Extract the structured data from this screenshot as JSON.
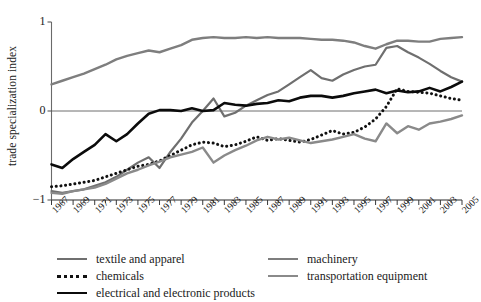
{
  "chart_data": {
    "type": "line",
    "title": "",
    "xlabel": "",
    "ylabel": "trade specialization index",
    "xlim": [
      1967,
      2005
    ],
    "ylim": [
      -1,
      1
    ],
    "yticks": [
      1,
      0,
      -1
    ],
    "ytick_labels": [
      "1",
      "0",
      "−1"
    ],
    "grid": false,
    "zero_line": true,
    "legend_position": "bottom",
    "x": [
      1967,
      1968,
      1969,
      1970,
      1971,
      1972,
      1973,
      1974,
      1975,
      1976,
      1977,
      1978,
      1979,
      1980,
      1981,
      1982,
      1983,
      1984,
      1985,
      1986,
      1987,
      1988,
      1989,
      1990,
      1991,
      1992,
      1993,
      1994,
      1995,
      1996,
      1997,
      1998,
      1999,
      2000,
      2001,
      2002,
      2003,
      2004,
      2005
    ],
    "xtick_labels": [
      "1967",
      "1969",
      "1971",
      "1973",
      "1975",
      "1977",
      "1979",
      "1981",
      "1983",
      "1985",
      "1987",
      "1989",
      "1991",
      "1993",
      "1995",
      "1997",
      "1999",
      "2001",
      "2003",
      "2005"
    ],
    "series": [
      {
        "name": "textile and apparel",
        "color": "#6f6f6f",
        "style": "solid",
        "width": 2.2,
        "values": [
          -0.9,
          -0.92,
          -0.9,
          -0.88,
          -0.84,
          -0.8,
          -0.74,
          -0.66,
          -0.58,
          -0.52,
          -0.64,
          -0.46,
          -0.31,
          -0.13,
          0.0,
          0.14,
          -0.06,
          -0.02,
          0.06,
          0.12,
          0.18,
          0.22,
          0.3,
          0.38,
          0.46,
          0.37,
          0.34,
          0.41,
          0.46,
          0.5,
          0.52,
          0.71,
          0.73,
          0.66,
          0.6,
          0.53,
          0.45,
          0.38,
          0.33
        ]
      },
      {
        "name": "chemicals",
        "color": "#111111",
        "style": "dotted",
        "width": 3.0,
        "values": [
          -0.85,
          -0.84,
          -0.82,
          -0.8,
          -0.78,
          -0.74,
          -0.7,
          -0.66,
          -0.62,
          -0.6,
          -0.56,
          -0.5,
          -0.44,
          -0.38,
          -0.35,
          -0.36,
          -0.4,
          -0.38,
          -0.34,
          -0.29,
          -0.33,
          -0.31,
          -0.33,
          -0.35,
          -0.32,
          -0.27,
          -0.22,
          -0.26,
          -0.24,
          -0.18,
          -0.09,
          0.05,
          0.25,
          0.22,
          0.21,
          0.2,
          0.17,
          0.14,
          0.12
        ]
      },
      {
        "name": "electrical and electronic products",
        "color": "#0b0b0b",
        "style": "solid",
        "width": 2.6,
        "values": [
          -0.6,
          -0.64,
          -0.54,
          -0.46,
          -0.38,
          -0.26,
          -0.34,
          -0.26,
          -0.14,
          -0.03,
          0.01,
          0.01,
          0.0,
          0.03,
          0.0,
          0.01,
          0.09,
          0.07,
          0.06,
          0.08,
          0.09,
          0.12,
          0.11,
          0.15,
          0.17,
          0.17,
          0.15,
          0.17,
          0.2,
          0.22,
          0.24,
          0.2,
          0.23,
          0.21,
          0.22,
          0.26,
          0.22,
          0.27,
          0.33
        ]
      },
      {
        "name": "machinery",
        "color": "#7e7e7e",
        "style": "solid",
        "width": 2.4,
        "values": [
          0.3,
          0.34,
          0.38,
          0.42,
          0.47,
          0.52,
          0.58,
          0.62,
          0.65,
          0.68,
          0.66,
          0.7,
          0.74,
          0.8,
          0.82,
          0.83,
          0.82,
          0.82,
          0.83,
          0.82,
          0.83,
          0.82,
          0.82,
          0.82,
          0.81,
          0.8,
          0.8,
          0.79,
          0.77,
          0.73,
          0.7,
          0.75,
          0.79,
          0.79,
          0.78,
          0.78,
          0.81,
          0.82,
          0.83
        ]
      },
      {
        "name": "transportation equipment",
        "color": "#8a8a8a",
        "style": "solid",
        "width": 2.4,
        "values": [
          -0.92,
          -0.93,
          -0.9,
          -0.88,
          -0.86,
          -0.82,
          -0.76,
          -0.7,
          -0.66,
          -0.61,
          -0.57,
          -0.52,
          -0.49,
          -0.46,
          -0.41,
          -0.58,
          -0.5,
          -0.44,
          -0.39,
          -0.33,
          -0.29,
          -0.32,
          -0.3,
          -0.33,
          -0.36,
          -0.34,
          -0.32,
          -0.29,
          -0.26,
          -0.31,
          -0.34,
          -0.14,
          -0.25,
          -0.17,
          -0.21,
          -0.14,
          -0.12,
          -0.09,
          -0.05
        ]
      }
    ]
  },
  "legend": {
    "left_column": [
      {
        "label": "textile and apparel",
        "series": 0
      },
      {
        "label": "chemicals",
        "series": 1
      },
      {
        "label": "electrical and electronic products",
        "series": 2
      }
    ],
    "right_column": [
      {
        "label": "machinery",
        "series": 3
      },
      {
        "label": "transportation equipment",
        "series": 4
      }
    ]
  }
}
